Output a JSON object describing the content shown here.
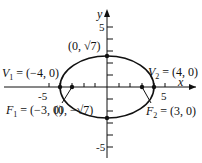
{
  "figure": {
    "type": "ellipse",
    "equation_params": {
      "a": 4,
      "b_squared": 7,
      "c": 3
    },
    "axes": {
      "x_label": "x",
      "y_label": "y",
      "x_ticks": [
        "-5",
        "5"
      ],
      "y_ticks": [
        "5",
        "-5"
      ]
    },
    "labels": {
      "v1_name": "V",
      "v1_sub": "1",
      "v1_value": " = (−4, 0)",
      "v2_name": "V",
      "v2_sub": "2",
      "v2_value": " = (4, 0)",
      "f1_name": "F",
      "f1_sub": "1",
      "f1_value": " = (−3, 0)",
      "f2_name": "F",
      "f2_sub": "2",
      "f2_value": " = (3, 0)",
      "top_point": "(0, √7)",
      "bottom_point": "(0, −√7)"
    },
    "colors": {
      "stroke": "#111111"
    }
  }
}
